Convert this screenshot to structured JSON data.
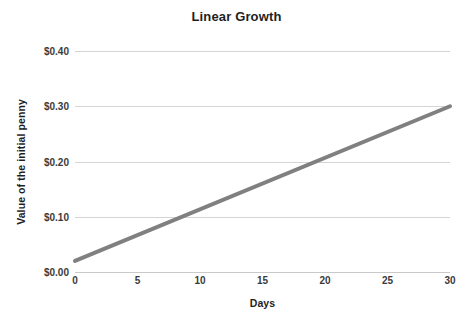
{
  "chart_data": {
    "type": "line",
    "title": "Linear Growth",
    "xlabel": "Days",
    "ylabel": "Value of the initial penny",
    "x": [
      0,
      30
    ],
    "series": [
      {
        "name": "Linear Growth",
        "values": [
          0.02,
          0.3
        ],
        "color": "#808080",
        "line_width": 4
      }
    ],
    "xlim": [
      0,
      30
    ],
    "ylim": [
      0.0,
      0.4
    ],
    "xticks": [
      0,
      5,
      10,
      15,
      20,
      25,
      30
    ],
    "xtick_labels": [
      "0",
      "5",
      "10",
      "15",
      "20",
      "25",
      "30"
    ],
    "yticks": [
      0.0,
      0.1,
      0.2,
      0.3,
      0.4
    ],
    "ytick_labels": [
      "$0.00",
      "$0.10",
      "$0.20",
      "$0.30",
      "$0.40"
    ],
    "grid": "horizontal",
    "legend": "none",
    "background_color": "#ffffff",
    "gridline_color": "#d4d4d4"
  }
}
